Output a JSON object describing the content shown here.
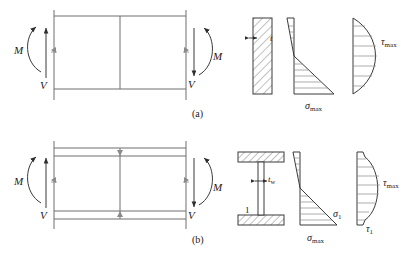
{
  "figure": {
    "panels": [
      {
        "key": "a",
        "caption": "(a)",
        "section_type": "rectangular",
        "beam": {
          "moment_label": "M",
          "shear_label": "V",
          "moment_label_right": "M",
          "shear_label_right": "V"
        },
        "cross_section": {
          "name": "rectangular-section",
          "thickness_label": "t",
          "hatched": true
        },
        "normal_stress_diagram": {
          "name": "bending-stress-distribution",
          "shape": "linear",
          "labels": [
            "σmax"
          ]
        },
        "shear_stress_diagram": {
          "name": "shear-stress-distribution",
          "shape": "parabolic",
          "labels": [
            "τmax"
          ]
        }
      },
      {
        "key": "b",
        "caption": "(b)",
        "section_type": "i-beam",
        "beam": {
          "moment_label": "M",
          "shear_label": "V",
          "moment_label_right": "M",
          "shear_label_right": "V"
        },
        "cross_section": {
          "name": "i-section",
          "web_thickness_label": "tw",
          "point_label": "1",
          "hatched": true
        },
        "normal_stress_diagram": {
          "name": "bending-stress-distribution",
          "shape": "linear",
          "labels": [
            "σ1",
            "σmax"
          ]
        },
        "shear_stress_diagram": {
          "name": "shear-stress-distribution",
          "shape": "parabolic-stepped",
          "labels": [
            "τmax",
            "τ1"
          ]
        }
      }
    ],
    "symbols": {
      "sigma": "σ",
      "tau": "τ",
      "sub_max": "max",
      "sub_one": "1",
      "sub_w": "w",
      "label_M": "M",
      "label_V": "V",
      "label_t": "t",
      "label_1": "1",
      "caption_a": "(a)",
      "caption_b": "(b)",
      "sigma_max": "σmax",
      "tau_max": "τmax",
      "sigma_1": "σ1",
      "tau_1": "τ1"
    },
    "colors": {
      "line": "#3a3a3a",
      "line_light": "#8a8a8a",
      "text": "#1a1a1a",
      "background": "#ffffff"
    }
  }
}
